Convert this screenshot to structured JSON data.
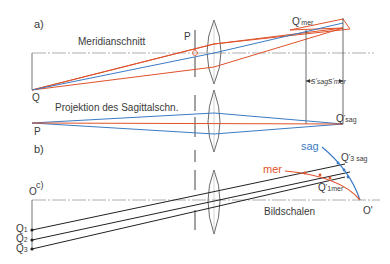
{
  "panels": {
    "a": {
      "label": "a)",
      "title": "Meridianschnitt",
      "point_P": "P",
      "point_Q": "Q",
      "image_mer": {
        "main": "Q",
        "prime": "'",
        "sub": "mer"
      },
      "dist_sag": {
        "main": "s",
        "prime": "'",
        "sub": "sag"
      },
      "dist_mer": {
        "main": "s",
        "prime": "'",
        "sub": "mer"
      }
    },
    "b": {
      "label": "b)",
      "title": "Projektion des Sagittalschn.",
      "point_P": "P",
      "image_sag": {
        "main": "Q",
        "prime": "'",
        "sub": "sag"
      }
    },
    "c": {
      "label": "c)",
      "point_O": "O",
      "points_Q": [
        {
          "main": "Q",
          "sub": "1"
        },
        {
          "main": "Q",
          "sub": "2"
        },
        {
          "main": "Q",
          "sub": "3"
        }
      ],
      "curve_sag": "sag",
      "curve_mer": "mer",
      "image_Q3sag": {
        "main": "Q",
        "prime": "'",
        "sub": "3",
        "sub2": "sag"
      },
      "image_Q1mer": {
        "main": "Q",
        "prime": "'",
        "sub": "1mer"
      },
      "image_O": "O'",
      "title": "Bildschalen"
    }
  },
  "colors": {
    "meridional": "#e0522a",
    "sagittal": "#3b7bc4",
    "chief": "#333333",
    "axis": "#888888"
  }
}
